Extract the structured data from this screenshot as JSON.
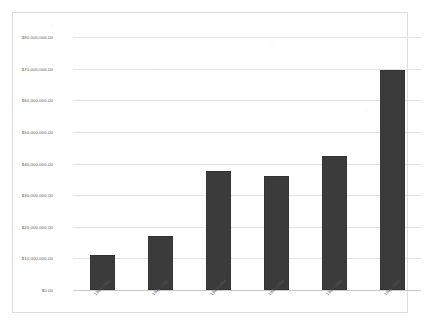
{
  "chart_data": {
    "type": "bar",
    "title": "",
    "subtitle": "",
    "xlabel": "",
    "ylabel": "",
    "categories": [
      "1989-1990",
      "1991-1992",
      "1993-1994",
      "1995-1996",
      "1997-1998",
      "1999-2000"
    ],
    "values": [
      11000000,
      17000000,
      37500000,
      36000000,
      42500000,
      69500000
    ],
    "value_labels": [
      "$11,000,000.00",
      "$17,000,000.00",
      "$37,500,000.00",
      "$36,000,000.00",
      "$42,500,000.00",
      "$69,500,000.00"
    ],
    "ylim": [
      0,
      80000000
    ],
    "ytick_values": [
      80000000,
      70000000,
      60000000,
      50000000,
      40000000,
      30000000,
      20000000,
      10000000,
      0
    ],
    "ytick_labels": [
      "$80,000,000.00",
      "$70,000,000.00",
      "$60,000,000.00",
      "$50,000,000.00",
      "$40,000,000.00",
      "$30,000,000.00",
      "$20,000,000.00",
      "$10,000,000.00",
      "$0.00"
    ],
    "grid": true,
    "legend": false,
    "legend_position": "none",
    "series": [
      {
        "name": "",
        "values": [
          11000000,
          17000000,
          37500000,
          36000000,
          42500000,
          69500000
        ]
      }
    ],
    "colors": {
      "bar": "#3b3b3b",
      "gridline": "#e3e3e3",
      "baseline": "#c9c9c9",
      "frame": "#dcdcdc",
      "tick_text": "#5e5e5e",
      "background": "#ffffff"
    }
  }
}
